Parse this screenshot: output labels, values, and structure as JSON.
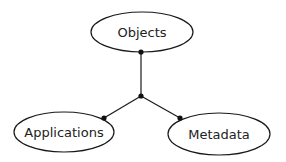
{
  "diagram": {
    "nodes": [
      {
        "id": "objects",
        "label": "Objects",
        "cx": 142,
        "cy": 32,
        "rx": 51,
        "ry": 20
      },
      {
        "id": "applications",
        "label": "Applications",
        "cx": 64,
        "cy": 132,
        "rx": 50,
        "ry": 20
      },
      {
        "id": "metadata",
        "label": "Metadata",
        "cx": 219,
        "cy": 134,
        "rx": 51,
        "ry": 21
      }
    ],
    "junction": {
      "x": 141,
      "y": 96
    },
    "edges": [
      {
        "from": "objects",
        "to": "junction",
        "port": {
          "x": 141,
          "y": 52
        }
      },
      {
        "from": "junction",
        "to": "applications",
        "port": {
          "x": 104,
          "y": 118
        }
      },
      {
        "from": "junction",
        "to": "metadata",
        "port": {
          "x": 180,
          "y": 118
        }
      }
    ],
    "colors": {
      "stroke": "#1a1a1a",
      "dot": "#111111",
      "text": "#222222",
      "background": "#ffffff"
    }
  }
}
